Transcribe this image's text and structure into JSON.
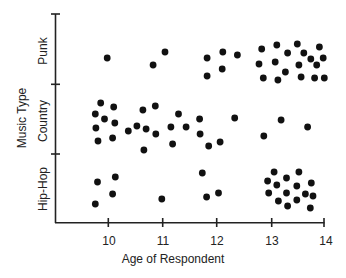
{
  "chart_data": {
    "type": "scatter",
    "title": "",
    "xlabel": "Age of Respondent",
    "ylabel": "Music Type",
    "x_ticks": [
      "10",
      "11",
      "12",
      "13",
      "14"
    ],
    "xlim": [
      9.0,
      14.0
    ],
    "categories": [
      "Hip-Hop",
      "Country",
      "Punk"
    ],
    "grid": false,
    "legend": null,
    "series": [
      {
        "name": "Punk",
        "points": [
          [
            9.98,
            58
          ],
          [
            10.83,
            65
          ],
          [
            11.05,
            52
          ],
          [
            11.83,
            58
          ],
          [
            11.83,
            76
          ],
          [
            12.12,
            52
          ],
          [
            12.11,
            69
          ],
          [
            12.39,
            55
          ],
          [
            12.79,
            64
          ],
          [
            12.84,
            49
          ],
          [
            12.87,
            78
          ],
          [
            13.09,
            62
          ],
          [
            13.12,
            45
          ],
          [
            13.14,
            80
          ],
          [
            13.28,
            72
          ],
          [
            13.32,
            53
          ],
          [
            13.5,
            44
          ],
          [
            13.53,
            65
          ],
          [
            13.57,
            77
          ],
          [
            13.62,
            53
          ],
          [
            13.75,
            59
          ],
          [
            13.82,
            78
          ],
          [
            13.86,
            65
          ],
          [
            13.91,
            47
          ],
          [
            13.98,
            58
          ],
          [
            14.0,
            78
          ]
        ]
      },
      {
        "name": "Country",
        "points": [
          [
            9.76,
            114
          ],
          [
            9.86,
            103
          ],
          [
            10.1,
            107
          ],
          [
            9.77,
            128
          ],
          [
            9.93,
            119
          ],
          [
            10.12,
            123
          ],
          [
            9.81,
            141
          ],
          [
            10.08,
            138
          ],
          [
            10.37,
            131
          ],
          [
            10.53,
            126
          ],
          [
            10.64,
            110
          ],
          [
            10.7,
            129
          ],
          [
            10.66,
            150
          ],
          [
            10.87,
            106
          ],
          [
            10.88,
            134
          ],
          [
            11.16,
            127
          ],
          [
            11.19,
            144
          ],
          [
            11.3,
            114
          ],
          [
            11.44,
            127
          ],
          [
            11.69,
            119
          ],
          [
            11.7,
            134
          ],
          [
            11.86,
            146
          ],
          [
            12.07,
            142
          ],
          [
            12.34,
            118
          ],
          [
            12.88,
            136
          ],
          [
            13.2,
            120
          ],
          [
            13.69,
            127
          ]
        ]
      },
      {
        "name": "Hip-Hop",
        "points": [
          [
            9.8,
            182
          ],
          [
            9.76,
            204
          ],
          [
            10.08,
            194
          ],
          [
            10.13,
            177
          ],
          [
            10.99,
            199
          ],
          [
            11.74,
            173
          ],
          [
            11.82,
            197
          ],
          [
            12.04,
            193
          ],
          [
            12.95,
            181
          ],
          [
            12.97,
            193
          ],
          [
            13.07,
            172
          ],
          [
            13.12,
            185
          ],
          [
            13.15,
            201
          ],
          [
            13.3,
            178
          ],
          [
            13.3,
            193
          ],
          [
            13.32,
            206
          ],
          [
            13.49,
            186
          ],
          [
            13.49,
            200
          ],
          [
            13.53,
            172
          ],
          [
            13.65,
            194
          ],
          [
            13.76,
            183
          ],
          [
            13.79,
            196
          ],
          [
            13.74,
            208
          ]
        ]
      }
    ]
  },
  "labels": {
    "ylabel": "Music Type",
    "xlabel": "Age of Respondent",
    "band_punk": "Punk",
    "band_country": "Country",
    "band_hiphop": "Hip-Hop",
    "tick_10": "10",
    "tick_11": "11",
    "tick_12": "12",
    "tick_13": "13",
    "tick_14": "14"
  },
  "colors": {
    "dot": "#111111",
    "axis": "#222222"
  }
}
